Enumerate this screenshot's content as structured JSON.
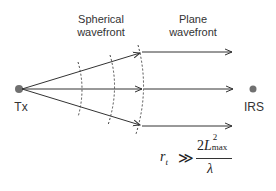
{
  "labels": {
    "spherical_line1": "Spherical",
    "spherical_line2": "wavefront",
    "plane_line1": "Plane",
    "plane_line2": "wavefront",
    "tx": "Tx",
    "irs": "IRS"
  },
  "formula": {
    "lhs": "r",
    "lhs_sub": "t",
    "relation": "≫",
    "numerator_coef": "2",
    "numerator_var": "L",
    "numerator_sup": "2",
    "numerator_sub": "max",
    "denominator": "λ"
  },
  "colors": {
    "node": "#707070",
    "line": "#333333"
  }
}
